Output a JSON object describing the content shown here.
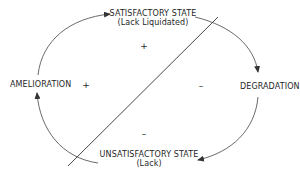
{
  "diagram": {
    "nodes": {
      "satisfactory": {
        "title": "SATISFACTORY STATE",
        "subtitle": "(Lack Liquidated)"
      },
      "degradation": {
        "title": "DEGRADATION"
      },
      "unsatisfactory": {
        "title": "UNSATISFACTORY STATE",
        "subtitle": "(Lack)"
      },
      "amelioration": {
        "title": "AMELIORATION"
      }
    },
    "signs": {
      "upper_top": "+",
      "upper_left": "+",
      "lower_right": "–",
      "lower_bottom": "–"
    },
    "cycle_order": [
      "SATISFACTORY STATE",
      "DEGRADATION",
      "UNSATISFACTORY STATE",
      "AMELIORATION"
    ],
    "colors": {
      "stroke": "#333333",
      "text": "#1f1f1f",
      "background": "#ffffff"
    }
  }
}
